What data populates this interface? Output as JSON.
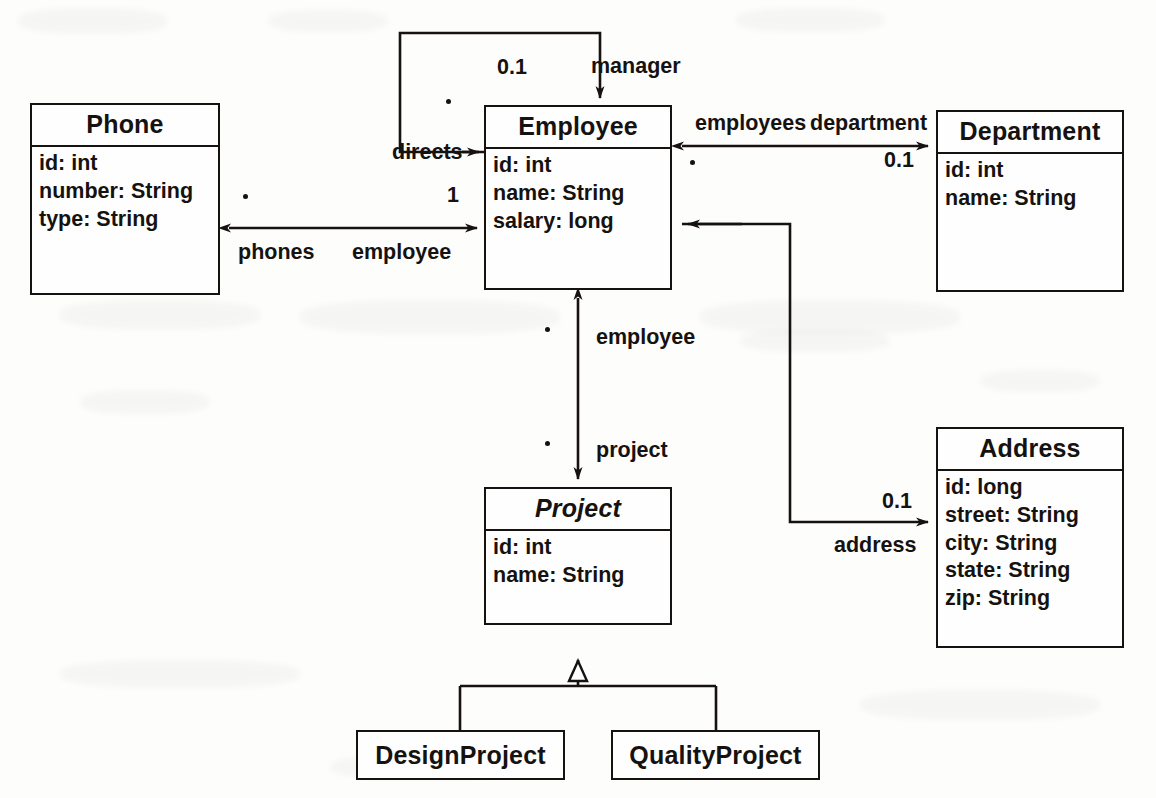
{
  "diagram": {
    "classes": [
      {
        "id": "phone",
        "name": "Phone",
        "abstract": false,
        "attributes": [
          "id: int",
          "number: String",
          "type: String"
        ]
      },
      {
        "id": "employee",
        "name": "Employee",
        "abstract": false,
        "attributes": [
          "id: int",
          "name: String",
          "salary: long"
        ]
      },
      {
        "id": "department",
        "name": "Department",
        "abstract": false,
        "attributes": [
          "id: int",
          "name: String"
        ]
      },
      {
        "id": "project",
        "name": "Project",
        "abstract": true,
        "attributes": [
          "id: int",
          "name: String"
        ]
      },
      {
        "id": "address",
        "name": "Address",
        "abstract": false,
        "attributes": [
          "id: long",
          "street: String",
          "city: String",
          "state: String",
          "zip: String"
        ]
      },
      {
        "id": "design-project",
        "name": "DesignProject",
        "abstract": false,
        "attributes": []
      },
      {
        "id": "quality-project",
        "name": "QualityProject",
        "abstract": false,
        "attributes": []
      }
    ],
    "associations": [
      {
        "id": "employee-manager-self",
        "from": "employee",
        "to": "employee",
        "role_source": "directs",
        "role_target": "manager",
        "mult_source": "*",
        "mult_target": "0.1"
      },
      {
        "id": "employee-department",
        "from": "employee",
        "to": "department",
        "role_source": "employees",
        "role_target": "department",
        "mult_source": "*",
        "mult_target": "0.1"
      },
      {
        "id": "phone-employee",
        "from": "phone",
        "to": "employee",
        "role_source": "phones",
        "role_target": "employee",
        "mult_source": "*",
        "mult_target": "1"
      },
      {
        "id": "employee-project",
        "from": "employee",
        "to": "project",
        "role_source": "employee",
        "role_target": "project",
        "mult_source": "*",
        "mult_target": "*"
      },
      {
        "id": "employee-address",
        "from": "employee",
        "to": "address",
        "role_source": "",
        "role_target": "address",
        "mult_source": "",
        "mult_target": "0.1"
      }
    ],
    "generalizations": [
      {
        "id": "design-project-to-project",
        "child": "design-project",
        "parent": "project"
      },
      {
        "id": "quality-project-to-project",
        "child": "quality-project",
        "parent": "project"
      }
    ],
    "labels": {
      "manager": "manager",
      "directs": "directs",
      "employees": "employees",
      "department": "department",
      "phones": "phones",
      "employee_phone_side": "employee",
      "employee_project_side": "employee",
      "project": "project",
      "address": "address"
    },
    "multiplicities": {
      "manager_01": "0.1",
      "department_01": "0.1",
      "employee_one": "1",
      "address_01": "0.1"
    },
    "colors": {
      "ink": "#15120f",
      "paper": "#fdfdfc"
    }
  }
}
